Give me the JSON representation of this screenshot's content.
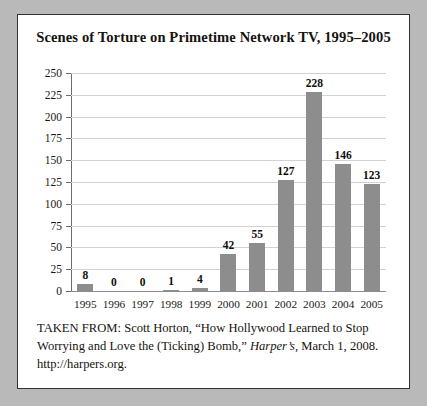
{
  "figure": {
    "title": "Scenes of Torture on Primetime Network TV, 1995–2005",
    "caption_line1_a": "TAKEN FROM: Scott Horton, “How Hollywood Learned to Stop Worrying and Love the (Ticking) Bomb,” ",
    "caption_source": "Harper’s",
    "caption_line1_b": ", March 1, 2008.",
    "caption_line2": "http://harpers.org."
  },
  "colors": {
    "bar_fill": "#8d8d8d",
    "gridline": "#d2d2d2",
    "axis": "#6e6c6a",
    "frame_border": "#33312f",
    "page_background": "#b9b9b9",
    "figure_background": "#ffffff",
    "text": "#16130f"
  },
  "chart_data": {
    "type": "bar",
    "title": "Scenes of Torture on Primetime Network TV, 1995–2005",
    "xlabel": "",
    "ylabel": "",
    "categories": [
      "1995",
      "1996",
      "1997",
      "1998",
      "1999",
      "2000",
      "2001",
      "2002",
      "2003",
      "2004",
      "2005"
    ],
    "values": [
      8,
      0,
      0,
      1,
      4,
      42,
      55,
      127,
      228,
      146,
      123
    ],
    "value_labels": [
      "8",
      "0",
      "0",
      "1",
      "4",
      "42",
      "55",
      "127",
      "228",
      "146",
      "123"
    ],
    "ylim": [
      0,
      250
    ],
    "ytick_values": [
      0,
      25,
      50,
      75,
      100,
      125,
      150,
      175,
      200,
      225,
      250
    ],
    "ytick_labels": [
      "0",
      "25",
      "50",
      "75",
      "100",
      "125",
      "150",
      "175",
      "200",
      "225",
      "250"
    ],
    "grid": true,
    "legend": false,
    "legend_position": "none",
    "data_labels": true
  }
}
